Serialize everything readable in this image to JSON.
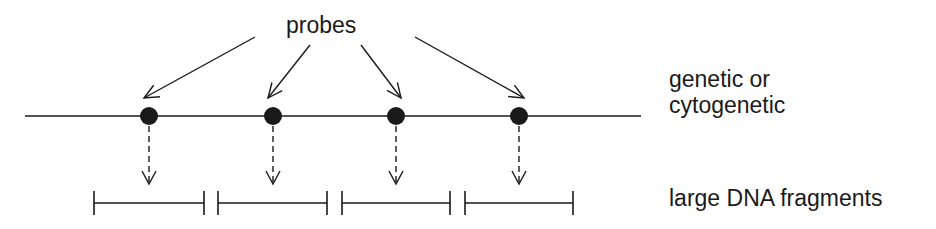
{
  "labels": {
    "probes": "probes",
    "map_line1": "genetic or",
    "map_line2": "cytogenetic",
    "fragments": "large DNA fragments"
  },
  "colors": {
    "ink": "#1a1a1a",
    "background": "#ffffff"
  },
  "map_line": {
    "x1": 25,
    "x2": 641,
    "y": 116
  },
  "probes": [
    {
      "x": 149,
      "arrow_from": [
        255,
        37
      ]
    },
    {
      "x": 273,
      "arrow_from": [
        310,
        45
      ]
    },
    {
      "x": 396,
      "arrow_from": [
        361,
        45
      ]
    },
    {
      "x": 519,
      "arrow_from": [
        415,
        37
      ]
    }
  ],
  "fragments": [
    {
      "x1": 94,
      "x2": 204
    },
    {
      "x1": 218,
      "x2": 327
    },
    {
      "x1": 342,
      "x2": 450
    },
    {
      "x1": 465,
      "x2": 573
    }
  ]
}
